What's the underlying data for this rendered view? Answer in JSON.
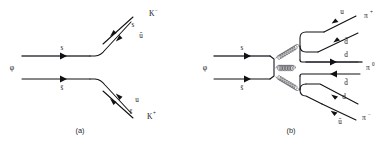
{
  "figure": {
    "background_color": "#ffffff",
    "line_color": "#111114",
    "gluon_color": "#5a5a62",
    "width": 392,
    "height": 144
  },
  "diagram_a": {
    "caption": "(a)",
    "initial_particle": "φ",
    "incoming_lines": [
      {
        "quark": "s",
        "position": "top"
      },
      {
        "quark": "s̄",
        "position": "bottom"
      }
    ],
    "outgoing_groups": [
      {
        "meson": "K",
        "charge": "−",
        "quarks": [
          "s",
          "ū"
        ],
        "direction": "upper-right"
      },
      {
        "meson": "K",
        "charge": "+",
        "quarks": [
          "u",
          "s̄"
        ],
        "direction": "lower-right"
      }
    ],
    "process": "φ → K⁻ K⁺"
  },
  "diagram_b": {
    "caption": "(b)",
    "initial_particle": "φ",
    "incoming_lines": [
      {
        "quark": "s",
        "position": "top"
      },
      {
        "quark": "s̄",
        "position": "bottom"
      }
    ],
    "gluons": [
      {
        "name": "gluon-upper",
        "direction": "upper-right"
      },
      {
        "name": "gluon-middle",
        "direction": "horizontal"
      },
      {
        "name": "gluon-lower",
        "direction": "lower-right"
      }
    ],
    "outgoing_groups": [
      {
        "meson": "π",
        "charge": "+",
        "quarks": [
          "u",
          "d̄"
        ],
        "direction": "upper-right"
      },
      {
        "meson": "π",
        "charge": "0",
        "quarks": [
          "d",
          "d̄"
        ],
        "direction": "horizontal"
      },
      {
        "meson": "π",
        "charge": "−",
        "quarks": [
          "d",
          "ū"
        ],
        "direction": "lower-right"
      }
    ],
    "process": "φ → π⁺ π⁰ π⁻"
  },
  "labels": {
    "a_phi": "φ",
    "a_s_top": "s",
    "a_sbar_bottom": "s̄",
    "a_s_out": "s",
    "a_ubar_out": "ū",
    "a_kminus": "K",
    "a_kminus_sup": "−",
    "a_u_out": "u",
    "a_sbar_out": "s̄",
    "a_kplus": "K",
    "a_kplus_sup": "+",
    "a_caption": "(a)",
    "b_phi": "φ",
    "b_s_top": "s",
    "b_sbar_bottom": "s̄",
    "b_u_1": "u",
    "b_dbar_1": "d̄",
    "b_piplus": "π",
    "b_piplus_sup": "+",
    "b_d_2": "d",
    "b_dbar_2": "d̄",
    "b_pizero": "π",
    "b_pizero_sup": "0",
    "b_d_3": "d",
    "b_ubar_3": "ū",
    "b_piminus": "π",
    "b_piminus_sup": "−",
    "b_caption": "(b)"
  }
}
